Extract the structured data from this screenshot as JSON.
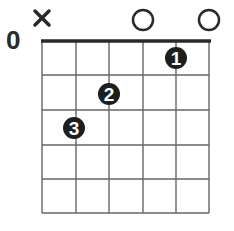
{
  "chord": {
    "name": "C major",
    "fret_position_label": "0",
    "strings": 6,
    "frets_shown": 5,
    "string_states": [
      "muted",
      "fretted",
      "fretted",
      "open",
      "fretted",
      "open"
    ],
    "string_marks": [
      {
        "string": 1,
        "mark": "x"
      },
      {
        "string": 4,
        "mark": "o"
      },
      {
        "string": 6,
        "mark": "o"
      }
    ],
    "fingers": [
      {
        "finger": "1",
        "string": 5,
        "fret": 1
      },
      {
        "finger": "2",
        "string": 3,
        "fret": 2
      },
      {
        "finger": "3",
        "string": 2,
        "fret": 3
      }
    ],
    "colors": {
      "line": "#555555",
      "nut": "#2a2a2a",
      "dot_fill": "#1e1e1e",
      "dot_text": "#ffffff",
      "marker": "#2a2a2a"
    }
  }
}
